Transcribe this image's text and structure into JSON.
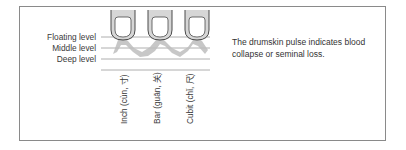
{
  "levels": [
    {
      "label": "Floating level"
    },
    {
      "label": "Middle level"
    },
    {
      "label": "Deep level"
    }
  ],
  "positions": [
    {
      "label": "Inch (cùn, 寸)"
    },
    {
      "label": "Bar (guān, 关)"
    },
    {
      "label": "Cubit (chǐ, 尺)"
    }
  ],
  "caption": "The drumskin pulse indicates blood collapse or seminal loss.",
  "colors": {
    "finger_fill": "#d6d6d6",
    "finger_stroke": "#4a4a4a",
    "pulse_wave": "#bdbdbd",
    "lines": "#9a9a9a",
    "frame": "#8a8a8a"
  }
}
